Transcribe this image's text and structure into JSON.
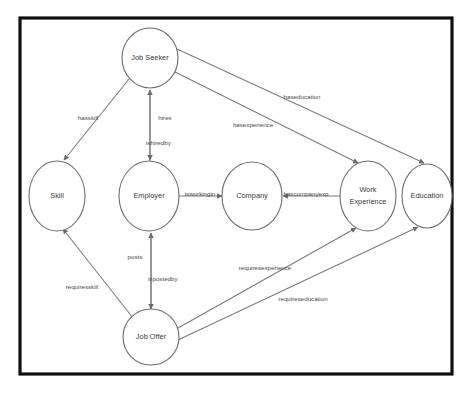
{
  "diagram": {
    "type": "directed-graph",
    "canvas": {
      "width": 470,
      "height": 394,
      "background": "#ffffff"
    },
    "frame": {
      "x": 20,
      "y": 18,
      "width": 432,
      "height": 356,
      "stroke": "#111111"
    },
    "style": {
      "node_fill": "#ffffff",
      "node_stroke": "#6d6d6d",
      "edge_stroke": "#7a7a7a",
      "label_color": "#4a4a4a"
    },
    "nodes": [
      {
        "id": "job_seeker",
        "label": "Job Seeker",
        "cx": 150,
        "cy": 58,
        "rx": 28,
        "ry": 30
      },
      {
        "id": "skill",
        "label": "Skill",
        "cx": 57,
        "cy": 196,
        "rx": 28,
        "ry": 35
      },
      {
        "id": "employer",
        "label": "Employer",
        "cx": 149,
        "cy": 196,
        "rx": 30,
        "ry": 35
      },
      {
        "id": "company",
        "label": "Company",
        "cx": 252,
        "cy": 196,
        "rx": 30,
        "ry": 34
      },
      {
        "id": "work_experience",
        "label": "Work Experience",
        "line1": "Work",
        "line2": "Experience",
        "cx": 368,
        "cy": 196,
        "rx": 28,
        "ry": 35
      },
      {
        "id": "education",
        "label": "Education",
        "cx": 427,
        "cy": 196,
        "rx": 25,
        "ry": 32
      },
      {
        "id": "job_offer",
        "label": "Job Offer",
        "cx": 151,
        "cy": 337,
        "rx": 28,
        "ry": 28
      }
    ],
    "edges": [
      {
        "id": "hasskill",
        "label": "hasskill",
        "from": "job_seeker",
        "to": "skill",
        "label_x": 88,
        "label_y": 118
      },
      {
        "id": "hires",
        "label": "hires",
        "from": "employer",
        "to": "job_seeker",
        "label_x": 165,
        "label_y": 118
      },
      {
        "id": "ishiredby",
        "label": "ishiredby",
        "from": "job_seeker",
        "to": "employer",
        "label_x": 150,
        "label_y": 143
      },
      {
        "id": "hasexperience",
        "label": "hasexperience",
        "from": "job_seeker",
        "to": "work_experience",
        "label_x": 253,
        "label_y": 125
      },
      {
        "id": "haseducation",
        "label": "haseducation",
        "from": "job_seeker",
        "to": "education",
        "label_x": 302,
        "label_y": 97
      },
      {
        "id": "isworkingin",
        "label": "isworkingin",
        "from": "employer",
        "to": "company",
        "label_x": 200,
        "label_y": 194
      },
      {
        "id": "hascompanyexp",
        "label": "hascompanyexp",
        "from": "work_experience",
        "to": "company",
        "label_x": 304,
        "label_y": 194
      },
      {
        "id": "posts",
        "label": "posts",
        "from": "job_offer",
        "to": "employer",
        "label_x": 135,
        "label_y": 257
      },
      {
        "id": "ispostedby",
        "label": "ispostedby",
        "from": "employer",
        "to": "job_offer",
        "label_x": 168,
        "label_y": 279
      },
      {
        "id": "requiresskill",
        "label": "requiresskill",
        "from": "job_offer",
        "to": "skill",
        "label_x": 82,
        "label_y": 287
      },
      {
        "id": "requiresexperience",
        "label": "requiresexperience",
        "from": "job_offer",
        "to": "work_experience",
        "label_x": 265,
        "label_y": 268
      },
      {
        "id": "requireseducation",
        "label": "requireseducation",
        "from": "job_offer",
        "to": "education",
        "label_x": 303,
        "label_y": 299
      }
    ]
  }
}
